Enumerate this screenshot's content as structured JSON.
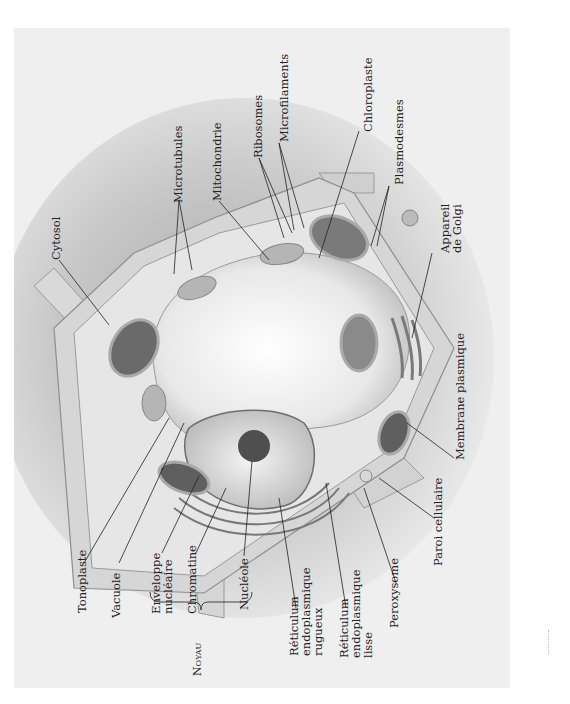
{
  "figure": {
    "labels_top": [
      {
        "id": "cytosol",
        "text": "Cytosol"
      },
      {
        "id": "microtubules",
        "text": "Microtubules"
      },
      {
        "id": "mitochondrie",
        "text": "Mitochondrie"
      },
      {
        "id": "ribosomes",
        "text": "Ribosomes"
      },
      {
        "id": "microfilaments",
        "text": "Microfilaments"
      },
      {
        "id": "chloroplaste",
        "text": "Chloroplaste"
      },
      {
        "id": "plasmodesmes",
        "text": "Plasmodesmes"
      },
      {
        "id": "golgi",
        "lines": [
          "Appareil",
          "de Golgi"
        ]
      }
    ],
    "labels_right": [
      {
        "id": "membrane",
        "text": "Membrane plasmique"
      },
      {
        "id": "paroi",
        "text": "Paroi cellulaire"
      }
    ],
    "labels_bottom": [
      {
        "id": "tonoplaste",
        "text": "Tonoplaste"
      },
      {
        "id": "vacuole",
        "text": "Vacuole"
      },
      {
        "id": "enveloppe",
        "lines": [
          "Enveloppe",
          "nucléaire"
        ]
      },
      {
        "id": "chromatine",
        "text": "Chromatine"
      },
      {
        "id": "nucleole",
        "text": "Nucléole"
      },
      {
        "id": "rer",
        "lines": [
          "Réticulum",
          "endoplasmique",
          "rugueux"
        ]
      },
      {
        "id": "rel",
        "lines": [
          "Réticulum",
          "endoplasmique",
          "lisse"
        ]
      },
      {
        "id": "peroxysome",
        "text": "Peroxysome"
      }
    ],
    "group_label": {
      "id": "noyau",
      "text": "Noyau"
    }
  },
  "colors": {
    "background": "#efefef",
    "wall": "#d6d6d6",
    "cytoplasm": "#e6e6e6",
    "vacuole": "#f7f7f7",
    "organelle_dark": "#555555",
    "leader": "#222222"
  }
}
